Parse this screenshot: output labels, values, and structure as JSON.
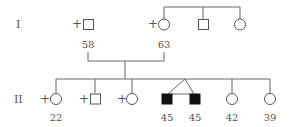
{
  "diagram": {
    "type": "pedigree",
    "colors": {
      "line": "#666666",
      "affected": "#111111",
      "text": "#555555"
    },
    "generations": [
      {
        "label": "I",
        "individuals": [
          {
            "id": "I-1",
            "sex": "male",
            "affected": false,
            "marked": "+",
            "age": "58"
          },
          {
            "id": "I-2",
            "sex": "female",
            "affected": false,
            "marked": "+",
            "age": "63"
          },
          {
            "id": "I-3",
            "sex": "male",
            "affected": false,
            "marked": "",
            "age": ""
          },
          {
            "id": "I-4",
            "sex": "female",
            "affected": false,
            "marked": "",
            "age": ""
          }
        ]
      },
      {
        "label": "II",
        "individuals": [
          {
            "id": "II-1",
            "sex": "female",
            "affected": false,
            "marked": "+",
            "age": "22"
          },
          {
            "id": "II-2",
            "sex": "male",
            "affected": false,
            "marked": "+",
            "age": ""
          },
          {
            "id": "II-3",
            "sex": "female",
            "affected": false,
            "marked": "+",
            "age": ""
          },
          {
            "id": "II-4",
            "sex": "male",
            "affected": true,
            "marked": "",
            "age": "45",
            "twin": "monozygotic"
          },
          {
            "id": "II-5",
            "sex": "male",
            "affected": true,
            "marked": "",
            "age": "45",
            "twin": "monozygotic"
          },
          {
            "id": "II-6",
            "sex": "female",
            "affected": false,
            "marked": "",
            "age": "42"
          },
          {
            "id": "II-7",
            "sex": "female",
            "affected": false,
            "marked": "",
            "age": "39"
          }
        ]
      }
    ]
  }
}
